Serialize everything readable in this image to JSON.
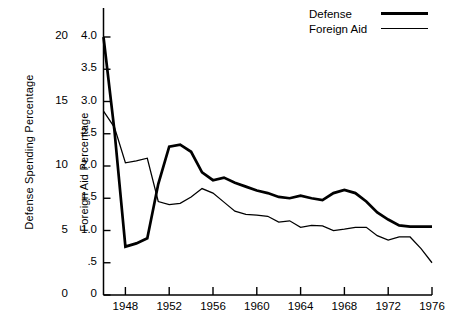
{
  "chart_data": {
    "type": "line",
    "title": "",
    "xlabel": "",
    "x": [
      1946,
      1947,
      1948,
      1949,
      1950,
      1951,
      1952,
      1953,
      1954,
      1955,
      1956,
      1957,
      1958,
      1959,
      1960,
      1961,
      1962,
      1963,
      1964,
      1965,
      1966,
      1967,
      1968,
      1969,
      1970,
      1971,
      1972,
      1973,
      1974,
      1975,
      1976
    ],
    "xlim": [
      1946,
      1976
    ],
    "xticks": [
      1948,
      1952,
      1956,
      1960,
      1964,
      1968,
      1972,
      1976
    ],
    "xticklabels": [
      "1948",
      "1952",
      "1956",
      "1960",
      "1964",
      "1968",
      "1972",
      "1976"
    ],
    "grid": false,
    "legend_position": "top-right",
    "axes": [
      {
        "id": "left",
        "label": "Defense Spending Percentage",
        "ylim": [
          0,
          20
        ],
        "yticks": [
          0,
          5,
          10,
          15,
          20
        ],
        "yticklabels": [
          "0",
          "5",
          "10",
          "15",
          "20"
        ],
        "axis_line": false
      },
      {
        "id": "right",
        "label": "Foreign Aid Percentage",
        "ylim": [
          0,
          4.0
        ],
        "yticks": [
          0,
          0.5,
          1.0,
          1.5,
          2.0,
          2.5,
          3.0,
          3.5,
          4.0
        ],
        "yticklabels": [
          "0",
          ".5",
          "1.0",
          "1.5",
          "2.0",
          "2.5",
          "3.0",
          "3.5",
          "4.0"
        ],
        "axis_line": true
      }
    ],
    "series": [
      {
        "name": "Defense",
        "axis": "right",
        "style": "thick",
        "color": "#000000",
        "values": [
          4.0,
          2.55,
          0.75,
          0.8,
          0.88,
          1.72,
          2.3,
          2.33,
          2.22,
          1.9,
          1.78,
          1.82,
          1.74,
          1.68,
          1.62,
          1.58,
          1.52,
          1.5,
          1.54,
          1.5,
          1.47,
          1.58,
          1.63,
          1.58,
          1.45,
          1.28,
          1.17,
          1.08,
          1.06,
          1.06,
          1.06
        ]
      },
      {
        "name": "Foreign Aid",
        "axis": "right",
        "style": "thin",
        "color": "#000000",
        "values": [
          2.85,
          2.6,
          2.05,
          2.08,
          2.12,
          1.45,
          1.4,
          1.42,
          1.52,
          1.65,
          1.58,
          1.44,
          1.3,
          1.25,
          1.24,
          1.22,
          1.13,
          1.15,
          1.05,
          1.08,
          1.07,
          1.0,
          1.02,
          1.05,
          1.05,
          0.92,
          0.85,
          0.9,
          0.9,
          0.72,
          0.5
        ]
      }
    ]
  },
  "legend": {
    "entries": [
      {
        "label": "Defense",
        "swatch": "thick-line-swatch"
      },
      {
        "label": "Foreign Aid",
        "swatch": "thin-line-swatch"
      }
    ]
  }
}
